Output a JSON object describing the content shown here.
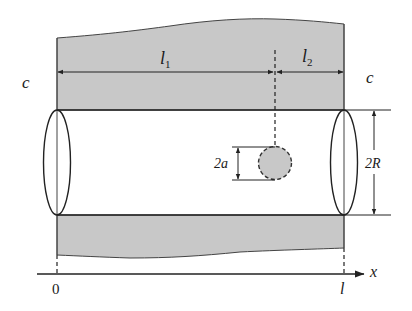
{
  "diagram": {
    "colors": {
      "shaded_region": "#c8c8c8",
      "stroke": "#222222",
      "inclusion_fill": "#c8c8c8"
    },
    "labels": {
      "left_section": "c",
      "right_section": "c",
      "length_1_main": "l",
      "length_1_sub": "1",
      "length_2_main": "l",
      "length_2_sub": "2",
      "inclusion_diameter": "2a",
      "cylinder_diameter": "2R",
      "axis_origin": "0",
      "axis_end": "l",
      "axis_name": "x"
    }
  }
}
